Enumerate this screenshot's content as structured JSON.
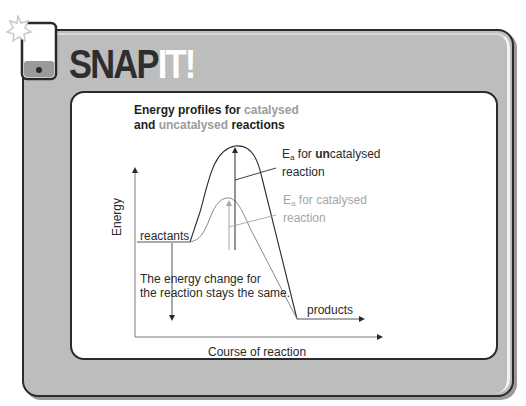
{
  "header": {
    "brand_dark": "SNAP",
    "brand_light": "IT!",
    "icon": "phone-with-star-icon"
  },
  "diagram": {
    "title_part1": "Energy profiles for ",
    "title_catalysed": "catalysed",
    "title_part2": "and ",
    "title_uncatalysed": "uncatalysed",
    "title_part3": " reactions",
    "y_axis_label": "Energy",
    "x_axis_label": "Course of reaction",
    "reactants_label": "reactants",
    "products_label": "products",
    "ea_uncat": {
      "symbol": "E",
      "subscript": "a",
      "text_before": " for ",
      "emphasis": "un",
      "text_after": "catalysed",
      "line2": "reaction"
    },
    "ea_cat": {
      "symbol": "E",
      "subscript": "a",
      "text": " for catalysed",
      "line2": "reaction"
    },
    "energy_change_line1": "The energy change for",
    "energy_change_line2": "the reaction stays the same."
  },
  "colors": {
    "frame": "#bdbdbd",
    "dark": "#2a2a2a",
    "catalysed_grey": "#a6a6a6",
    "panel": "#ffffff"
  }
}
